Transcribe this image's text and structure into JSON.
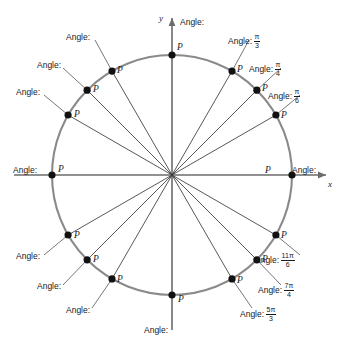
{
  "figure": {
    "axes": {
      "x_label": "x",
      "y_label": "y"
    },
    "point_label": "P",
    "angle_prefix": "Angle:",
    "colors": {
      "circle_stroke": "#8a8a8a",
      "radius_stroke": "#3a3a3a",
      "axis_stroke": "#6b6b6b",
      "point_fill": "#111111",
      "text": "#1a1a1a",
      "background": "#ffffff"
    },
    "geometry": {
      "center_x": 172,
      "center_y": 175,
      "radius": 120
    }
  },
  "points": [
    {
      "id": "p-000",
      "degrees": 0,
      "angle_prefix": "Angle:",
      "numerator": "",
      "denominator": "",
      "has_value": false
    },
    {
      "id": "p-030",
      "degrees": 30,
      "angle_prefix": "Angle:",
      "numerator": "π",
      "denominator": "6",
      "has_value": true
    },
    {
      "id": "p-045",
      "degrees": 45,
      "angle_prefix": "Angle:",
      "numerator": "π",
      "denominator": "4",
      "has_value": true
    },
    {
      "id": "p-060",
      "degrees": 60,
      "angle_prefix": "Angle:",
      "numerator": "π",
      "denominator": "3",
      "has_value": true
    },
    {
      "id": "p-090",
      "degrees": 90,
      "angle_prefix": "Angle:",
      "numerator": "",
      "denominator": "",
      "has_value": false
    },
    {
      "id": "p-120",
      "degrees": 120,
      "angle_prefix": "Angle:",
      "numerator": "",
      "denominator": "",
      "has_value": false
    },
    {
      "id": "p-135",
      "degrees": 135,
      "angle_prefix": "Angle:",
      "numerator": "",
      "denominator": "",
      "has_value": false
    },
    {
      "id": "p-150",
      "degrees": 150,
      "angle_prefix": "Angle:",
      "numerator": "",
      "denominator": "",
      "has_value": false
    },
    {
      "id": "p-180",
      "degrees": 180,
      "angle_prefix": "Angle:",
      "numerator": "",
      "denominator": "",
      "has_value": false
    },
    {
      "id": "p-210",
      "degrees": 210,
      "angle_prefix": "Angle:",
      "numerator": "",
      "denominator": "",
      "has_value": false
    },
    {
      "id": "p-225",
      "degrees": 225,
      "angle_prefix": "Angle:",
      "numerator": "",
      "denominator": "",
      "has_value": false
    },
    {
      "id": "p-240",
      "degrees": 240,
      "angle_prefix": "Angle:",
      "numerator": "",
      "denominator": "",
      "has_value": false
    },
    {
      "id": "p-270",
      "degrees": 270,
      "angle_prefix": "Angle:",
      "numerator": "",
      "denominator": "",
      "has_value": false
    },
    {
      "id": "p-300",
      "degrees": 300,
      "angle_prefix": "Angle:",
      "numerator": "5π",
      "denominator": "3",
      "has_value": true
    },
    {
      "id": "p-315",
      "degrees": 315,
      "angle_prefix": "Angle:",
      "numerator": "7π",
      "denominator": "4",
      "has_value": true
    },
    {
      "id": "p-330",
      "degrees": 330,
      "angle_prefix": "Angle:",
      "numerator": "11π",
      "denominator": "6",
      "has_value": true
    }
  ],
  "labels": {
    "deg0": {
      "prefix": "Angle:",
      "num": "",
      "den": ""
    },
    "deg30": {
      "prefix": "Angle:",
      "num": "π",
      "den": "6"
    },
    "deg45": {
      "prefix": "Angle:",
      "num": "π",
      "den": "4"
    },
    "deg60": {
      "prefix": "Angle:",
      "num": "π",
      "den": "3"
    },
    "deg90": {
      "prefix": "Angle:",
      "num": "",
      "den": ""
    },
    "deg120": {
      "prefix": "Angle:",
      "num": "",
      "den": ""
    },
    "deg135": {
      "prefix": "Angle:",
      "num": "",
      "den": ""
    },
    "deg150": {
      "prefix": "Angle:",
      "num": "",
      "den": ""
    },
    "deg180": {
      "prefix": "Angle:",
      "num": "",
      "den": ""
    },
    "deg210": {
      "prefix": "Angle:",
      "num": "",
      "den": ""
    },
    "deg225": {
      "prefix": "Angle:",
      "num": "",
      "den": ""
    },
    "deg240": {
      "prefix": "Angle:",
      "num": "",
      "den": ""
    },
    "deg270": {
      "prefix": "Angle:",
      "num": "",
      "den": ""
    },
    "deg300": {
      "prefix": "Angle:",
      "num": "5π",
      "den": "3"
    },
    "deg315": {
      "prefix": "Angle:",
      "num": "7π",
      "den": "4"
    },
    "deg330": {
      "prefix": "Angle:",
      "num": "11π",
      "den": "6"
    }
  },
  "point_markers": {
    "deg0": "P",
    "deg30": "P",
    "deg45": "P",
    "deg60": "P",
    "deg90": "P",
    "deg120": "P",
    "deg135": "P",
    "deg150": "P",
    "deg180": "P",
    "deg210": "P",
    "deg225": "P",
    "deg240": "P",
    "deg270": "P",
    "deg300": "P",
    "deg315": "P",
    "deg330": "P"
  },
  "axis_text": {
    "x": "x",
    "y": "y"
  }
}
